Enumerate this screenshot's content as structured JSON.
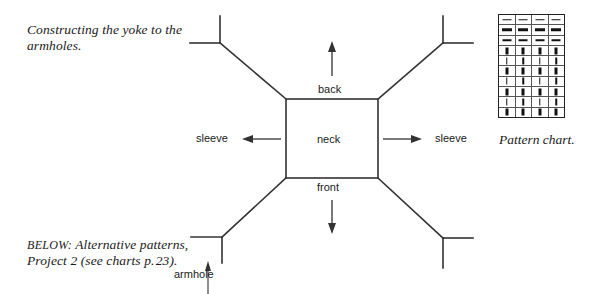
{
  "captions": {
    "top": "Constructing the yoke to the armholes.",
    "bottom_prefix": "BELOW:",
    "bottom_rest": " Alternative patterns, Project 2 (see charts p. 23)."
  },
  "pattern_chart": {
    "caption": "Pattern chart.",
    "columns": 4,
    "rows": 10,
    "cell_symbols": [
      [
        "dash-thin",
        "dash-thin",
        "dash-thin",
        "dash-thin"
      ],
      [
        "dash-thick",
        "dash-thick",
        "dash-thick",
        "dash-thick"
      ],
      [
        "dash-thin",
        "dash-thin",
        "dash-thin",
        "dash-thin"
      ],
      [
        "bar-thick",
        "bar-thick",
        "bar-thick",
        "bar-thick"
      ],
      [
        "bar-thin",
        "bar-thin",
        "bar-thin",
        "bar-thin"
      ],
      [
        "bar-thick",
        "bar-thick",
        "bar-thick",
        "bar-thick"
      ],
      [
        "bar-thin",
        "bar-thin",
        "bar-thin",
        "bar-thin"
      ],
      [
        "bar-thick",
        "bar-thick",
        "bar-thick",
        "bar-thick"
      ],
      [
        "bar-thin",
        "bar-thin",
        "bar-thin",
        "bar-thin"
      ],
      [
        "bar-thick",
        "bar-thick",
        "bar-thick",
        "bar-thick"
      ]
    ]
  },
  "diagram": {
    "labels": {
      "back": "back",
      "neck": "neck",
      "front": "front",
      "sleeve_left": "sleeve",
      "sleeve_right": "sleeve",
      "armhole": "armhole"
    },
    "line_color": "#333333",
    "stroke_width": 1.6,
    "neck_square": {
      "x": 286,
      "y": 99,
      "width": 92,
      "height": 79
    },
    "arrows": [
      {
        "name": "back-arrow",
        "direction": "up",
        "x1": 332,
        "y1": 76,
        "x2": 332,
        "y2": 44
      },
      {
        "name": "front-arrow",
        "direction": "down",
        "x1": 332,
        "y1": 200,
        "x2": 332,
        "y2": 232
      },
      {
        "name": "sleeve-left-arrow",
        "direction": "left",
        "x1": 281,
        "y1": 139,
        "x2": 244,
        "y2": 139
      },
      {
        "name": "sleeve-right-arrow",
        "direction": "right",
        "x1": 383,
        "y1": 139,
        "x2": 420,
        "y2": 139
      },
      {
        "name": "armhole-arrow",
        "direction": "up",
        "x1": 208,
        "y1": 294,
        "x2": 208,
        "y2": 262
      }
    ]
  },
  "colors": {
    "background": "#ffffff",
    "ink": "#1a1a1a",
    "rule": "#555555"
  }
}
